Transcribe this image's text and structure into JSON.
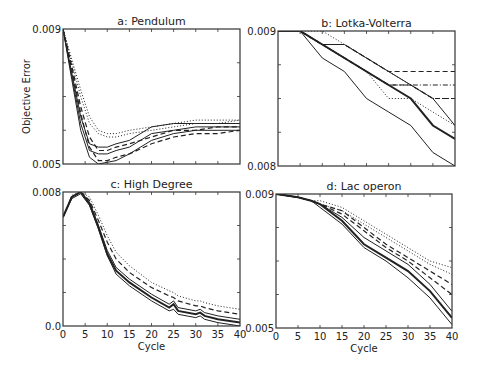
{
  "figure": {
    "ylabel": "Objective Error",
    "xlabel": "Cycle"
  },
  "chart_data": [
    {
      "type": "line",
      "title": "a: Pendulum",
      "xlabel": "",
      "ylabel": "Objective Error",
      "xlim": [
        0,
        40
      ],
      "ylim": [
        0.005,
        0.009
      ],
      "ytick_labels": [
        "0.009",
        "0.005"
      ],
      "x": [
        0,
        2,
        4,
        6,
        8,
        10,
        12,
        15,
        20,
        25,
        30,
        35,
        40
      ],
      "series": [
        {
          "name": "solid-1",
          "style": "solid",
          "values": [
            0.009,
            0.0075,
            0.006,
            0.0052,
            0.005,
            0.00505,
            0.0051,
            0.0053,
            0.0057,
            0.0059,
            0.006,
            0.006,
            0.006
          ]
        },
        {
          "name": "solid-2",
          "style": "solid",
          "values": [
            0.009,
            0.0076,
            0.0062,
            0.0054,
            0.0053,
            0.0053,
            0.0054,
            0.0055,
            0.0059,
            0.006,
            0.0061,
            0.0061,
            0.0061
          ]
        },
        {
          "name": "solid-3",
          "style": "solid",
          "values": [
            0.009,
            0.0077,
            0.0064,
            0.0056,
            0.0055,
            0.0055,
            0.0056,
            0.0057,
            0.0061,
            0.0062,
            0.0062,
            0.0062,
            0.0062
          ]
        },
        {
          "name": "dashed-1",
          "style": "dashed",
          "values": [
            0.009,
            0.0078,
            0.0065,
            0.0055,
            0.0051,
            0.0051,
            0.0052,
            0.0053,
            0.0056,
            0.0058,
            0.0059,
            0.0059,
            0.006
          ]
        },
        {
          "name": "dashed-2",
          "style": "dashed",
          "values": [
            0.009,
            0.0079,
            0.0067,
            0.0058,
            0.0054,
            0.0054,
            0.0055,
            0.0056,
            0.0058,
            0.006,
            0.006,
            0.0061,
            0.0061
          ]
        },
        {
          "name": "dotted-1",
          "style": "dotted",
          "values": [
            0.009,
            0.008,
            0.007,
            0.0062,
            0.0059,
            0.0058,
            0.0058,
            0.0059,
            0.006,
            0.0061,
            0.0062,
            0.0062,
            0.0063
          ]
        },
        {
          "name": "dotted-2",
          "style": "dotted",
          "values": [
            0.009,
            0.0081,
            0.0072,
            0.0064,
            0.006,
            0.0059,
            0.0059,
            0.006,
            0.0061,
            0.0062,
            0.0063,
            0.0063,
            0.0063
          ]
        }
      ]
    },
    {
      "type": "line",
      "title": "b: Lotka-Volterra",
      "xlabel": "",
      "ylabel": "",
      "xlim": [
        0,
        40
      ],
      "ylim": [
        0.008,
        0.009
      ],
      "ytick_labels": [
        "0.009",
        "0.008"
      ],
      "x": [
        0,
        5,
        10,
        15,
        20,
        25,
        30,
        35,
        40
      ],
      "series": [
        {
          "name": "solid-low",
          "style": "solid",
          "values": [
            0.009,
            0.009,
            0.0088,
            0.0087,
            0.0085,
            0.0084,
            0.0083,
            0.0081,
            0.008
          ]
        },
        {
          "name": "solid-mean",
          "style": "solid-bold",
          "values": [
            0.009,
            0.009,
            0.0089,
            0.0088,
            0.0087,
            0.0086,
            0.0085,
            0.0083,
            0.0082
          ]
        },
        {
          "name": "solid-high",
          "style": "solid",
          "values": [
            0.009,
            0.009,
            0.0089,
            0.0089,
            0.0088,
            0.0087,
            0.0086,
            0.0085,
            0.0083
          ]
        },
        {
          "name": "dashed-1",
          "style": "dashed",
          "values": [
            0.009,
            0.009,
            0.0089,
            0.0089,
            0.0088,
            0.0087,
            0.0087,
            0.0087,
            0.0087
          ]
        },
        {
          "name": "dashed-2",
          "style": "dashed",
          "values": [
            0.009,
            0.009,
            0.0089,
            0.0088,
            0.0087,
            0.0086,
            0.0086,
            0.0085,
            0.0085
          ]
        },
        {
          "name": "dashdot",
          "style": "dashdot",
          "values": [
            0.009,
            0.009,
            0.0089,
            0.0088,
            0.0087,
            0.0086,
            0.0086,
            0.0086,
            0.0086
          ]
        },
        {
          "name": "dotted-1",
          "style": "dotted",
          "values": [
            0.009,
            0.009,
            0.009,
            0.0089,
            0.0088,
            0.0087,
            0.0086,
            0.0085,
            0.0085
          ]
        },
        {
          "name": "dotted-2",
          "style": "dotted",
          "values": [
            0.009,
            0.009,
            0.0089,
            0.0088,
            0.0087,
            0.0085,
            0.0085,
            0.0084,
            0.0083
          ]
        }
      ]
    },
    {
      "type": "line",
      "title": "c: High Degree",
      "xlabel": "Cycle",
      "ylabel": "",
      "xlim": [
        0,
        40
      ],
      "ylim": [
        0.0,
        0.008
      ],
      "ytick_labels": [
        "0.008",
        "0.0"
      ],
      "xticks": [
        0,
        5,
        10,
        15,
        20,
        25,
        30,
        35,
        40
      ],
      "x": [
        0,
        2,
        4,
        6,
        8,
        10,
        12,
        15,
        20,
        24,
        25,
        26,
        30,
        31,
        32,
        35,
        40
      ],
      "series": [
        {
          "name": "solid-low",
          "style": "solid",
          "values": [
            0.0065,
            0.0076,
            0.0079,
            0.0072,
            0.0058,
            0.0042,
            0.0031,
            0.0024,
            0.0015,
            0.0009,
            0.001,
            0.0007,
            0.0005,
            0.0006,
            0.0004,
            0.0002,
            0.0
          ]
        },
        {
          "name": "solid-mean",
          "style": "solid-bold",
          "values": [
            0.0065,
            0.0077,
            0.008,
            0.0073,
            0.0059,
            0.0043,
            0.0033,
            0.0026,
            0.0017,
            0.0011,
            0.0013,
            0.0009,
            0.0007,
            0.0008,
            0.0006,
            0.0004,
            0.0002
          ]
        },
        {
          "name": "solid-high",
          "style": "solid",
          "values": [
            0.0065,
            0.0077,
            0.008,
            0.0074,
            0.006,
            0.0045,
            0.0035,
            0.0028,
            0.0019,
            0.0013,
            0.0015,
            0.0011,
            0.0009,
            0.001,
            0.0008,
            0.0006,
            0.0004
          ]
        },
        {
          "name": "dashed",
          "style": "dashed",
          "values": [
            0.0065,
            0.0077,
            0.008,
            0.0075,
            0.0063,
            0.005,
            0.004,
            0.0032,
            0.0023,
            0.0018,
            0.0017,
            0.0015,
            0.0012,
            0.0012,
            0.0011,
            0.0009,
            0.0007
          ]
        },
        {
          "name": "dotted",
          "style": "dotted",
          "values": [
            0.0065,
            0.0078,
            0.008,
            0.0077,
            0.0066,
            0.0054,
            0.0044,
            0.0036,
            0.0026,
            0.0021,
            0.002,
            0.0018,
            0.0015,
            0.0015,
            0.0014,
            0.0012,
            0.001
          ]
        }
      ]
    },
    {
      "type": "line",
      "title": "d: Lac operon",
      "xlabel": "Cycle",
      "ylabel": "",
      "xlim": [
        0,
        40
      ],
      "ylim": [
        0.005,
        0.009
      ],
      "ytick_labels": [
        "0.009",
        "0.005"
      ],
      "xticks": [
        0,
        5,
        10,
        15,
        20,
        25,
        30,
        35,
        40
      ],
      "x": [
        0,
        5,
        8,
        10,
        15,
        20,
        25,
        30,
        35,
        40
      ],
      "series": [
        {
          "name": "solid-low",
          "style": "solid",
          "values": [
            0.009,
            0.0089,
            0.0088,
            0.0086,
            0.0081,
            0.0074,
            0.007,
            0.0065,
            0.0059,
            0.0051
          ]
        },
        {
          "name": "solid-mean",
          "style": "solid-bold",
          "values": [
            0.009,
            0.0089,
            0.0088,
            0.0087,
            0.0082,
            0.0075,
            0.0071,
            0.0067,
            0.0061,
            0.0053
          ]
        },
        {
          "name": "solid-high",
          "style": "solid",
          "values": [
            0.009,
            0.0089,
            0.0088,
            0.0087,
            0.0083,
            0.0077,
            0.0073,
            0.0069,
            0.0063,
            0.0055
          ]
        },
        {
          "name": "dashed-1",
          "style": "dashed",
          "values": [
            0.009,
            0.0089,
            0.0088,
            0.0087,
            0.0084,
            0.0079,
            0.0074,
            0.007,
            0.0065,
            0.006
          ]
        },
        {
          "name": "dashed-2",
          "style": "dashed",
          "values": [
            0.009,
            0.0089,
            0.0088,
            0.0087,
            0.0085,
            0.008,
            0.0075,
            0.0071,
            0.0067,
            0.0063
          ]
        },
        {
          "name": "dotted-1",
          "style": "dotted",
          "values": [
            0.009,
            0.0089,
            0.0088,
            0.0087,
            0.0085,
            0.0081,
            0.0077,
            0.0073,
            0.0069,
            0.0066
          ]
        },
        {
          "name": "dotted-2",
          "style": "dotted",
          "values": [
            0.009,
            0.0089,
            0.0088,
            0.0088,
            0.0086,
            0.0082,
            0.0078,
            0.0074,
            0.007,
            0.0068
          ]
        }
      ]
    }
  ]
}
